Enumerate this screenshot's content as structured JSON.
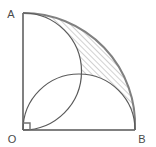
{
  "figure": {
    "width": 156,
    "height": 147,
    "background_color": "#ffffff",
    "stroke_color": "#808080",
    "arc_stroke_color": "#5a5a5a",
    "hatch_color": "#9a9a9a",
    "label_color": "#4a4a4a"
  },
  "vertices": [
    {
      "name": "A",
      "label": "A",
      "x": 23,
      "y": 13,
      "label_x": 11,
      "label_y": 14
    },
    {
      "name": "O",
      "label": "O",
      "x": 23,
      "y": 130,
      "label_x": 10,
      "label_y": 142
    },
    {
      "name": "B",
      "label": "B",
      "x": 135,
      "y": 130,
      "label_x": 140,
      "label_y": 142
    }
  ],
  "segments": [
    {
      "name": "side-OA",
      "from": "O",
      "to": "A",
      "x1": 23,
      "y1": 130,
      "x2": 23,
      "y2": 13
    },
    {
      "name": "side-OB",
      "from": "O",
      "to": "B",
      "x1": 23,
      "y1": 130,
      "x2": 135,
      "y2": 130
    }
  ],
  "right_angle": {
    "at": "O",
    "size": 7,
    "x": 23,
    "y": 130
  },
  "arcs": [
    {
      "name": "quarter-circle-AB",
      "description": "Quarter circle centred at O from A to B",
      "center_x": 23,
      "center_y": 130,
      "radius": 112,
      "start_x": 23,
      "start_y": 13,
      "end_x": 135,
      "end_y": 130
    },
    {
      "name": "semicircle-on-OA",
      "description": "Semicircle with diameter OA bulging to the right",
      "center_x": 23,
      "center_y": 71.5,
      "radius": 58.5,
      "start_x": 23,
      "start_y": 13,
      "end_x": 23,
      "end_y": 130
    },
    {
      "name": "semicircle-on-OB",
      "description": "Semicircle with diameter OB bulging upward",
      "center_x": 79,
      "center_y": 130,
      "radius": 56,
      "start_x": 23,
      "start_y": 130,
      "end_x": 135,
      "end_y": 130
    }
  ],
  "intersection_point": {
    "name": "arc-intersection",
    "x": 79,
    "y": 70
  },
  "shaded_region": {
    "name": "hatched-lune",
    "fill_pattern": "diagonal-hatch",
    "hatch_angle_deg": 45,
    "hatch_spacing": 4,
    "description": "Region bounded outside by the quarter circle arc AB and inside by the two semicircles"
  }
}
